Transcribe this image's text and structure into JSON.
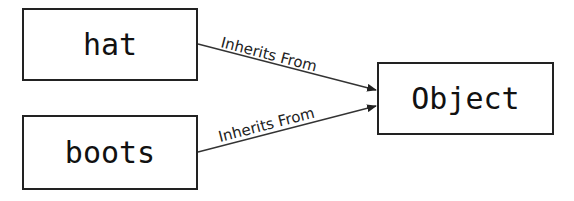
{
  "diagram": {
    "type": "inheritance",
    "nodes": [
      {
        "id": "hat",
        "label": "hat"
      },
      {
        "id": "boots",
        "label": "boots"
      },
      {
        "id": "object",
        "label": "Object"
      }
    ],
    "edges": [
      {
        "from": "hat",
        "to": "object",
        "label": "Inherits From"
      },
      {
        "from": "boots",
        "to": "object",
        "label": "Inherits From"
      }
    ],
    "colors": {
      "border": "#222222",
      "text": "#111111",
      "background": "#ffffff"
    }
  }
}
